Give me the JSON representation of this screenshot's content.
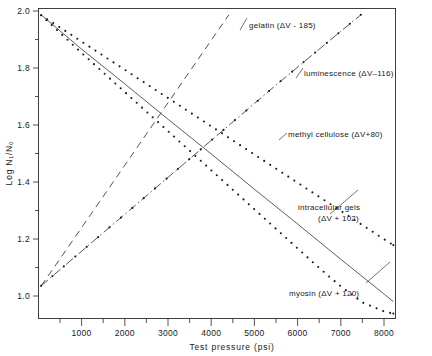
{
  "figure": {
    "background": "#ffffff",
    "ink_color": "#1a1a1a"
  },
  "axes": {
    "x_title": "Test pressure (psi)",
    "y_title": "Log N₁/N₀",
    "x_ticks": [
      "1000",
      "2000",
      "3000",
      "4000",
      "5000",
      "6000",
      "7000",
      "8000"
    ],
    "y_ticks": [
      "2.0",
      "1.8",
      "1.6",
      "1.4",
      "1.2",
      "1.0"
    ]
  },
  "labels": {
    "gelatin": "gelatin (ΔV - 185)",
    "luminescence": "luminescence (ΔV–116)",
    "methyl_cellulose": "methyl cellulose (ΔV+80)",
    "intracellular_gels_line1": "intracellular  gels",
    "intracellular_gels_line2": "(ΔV + 102)",
    "myosin": "myosin  (ΔV + 120)"
  },
  "chart_data": {
    "type": "line",
    "title": "",
    "xlabel": "Test pressure (psi)",
    "ylabel": "Log N₁/N₀",
    "xlim": [
      0,
      8250
    ],
    "ylim": [
      0.88,
      2.02
    ],
    "xticks": [
      1000,
      2000,
      3000,
      4000,
      5000,
      6000,
      7000,
      8000
    ],
    "yticks": [
      1.0,
      1.2,
      1.4,
      1.6,
      1.8,
      2.0
    ],
    "x_minor_ticks": [
      500,
      1500,
      2500,
      3500,
      4500,
      5500,
      6500,
      7500
    ],
    "y_minor_ticks": [
      1.1,
      1.3,
      1.5,
      1.7,
      1.9
    ],
    "grid": false,
    "legend": "annotations-inline",
    "series": [
      {
        "name": "gelatin (ΔV - 185)",
        "style": "dashed",
        "marker": "none",
        "delta_v": -185,
        "direction": "ascending",
        "points": [
          [
            60,
            1.0
          ],
          [
            500,
            1.1
          ],
          [
            1000,
            1.215
          ],
          [
            1500,
            1.33
          ],
          [
            2000,
            1.445
          ],
          [
            2500,
            1.56
          ],
          [
            3000,
            1.675
          ],
          [
            3500,
            1.79
          ],
          [
            4000,
            1.905
          ],
          [
            4400,
            1.997
          ]
        ]
      },
      {
        "name": "luminescence (ΔV–116)",
        "style": "dash-dot-with-dots",
        "marker": "dot",
        "delta_v": -116,
        "direction": "ascending",
        "points": [
          [
            60,
            1.0
          ],
          [
            500,
            1.06
          ],
          [
            1000,
            1.128
          ],
          [
            1500,
            1.196
          ],
          [
            2000,
            1.264
          ],
          [
            2500,
            1.332
          ],
          [
            3000,
            1.4
          ],
          [
            3500,
            1.468
          ],
          [
            4000,
            1.536
          ],
          [
            4500,
            1.604
          ],
          [
            5000,
            1.672
          ],
          [
            5500,
            1.74
          ],
          [
            6000,
            1.806
          ],
          [
            6500,
            1.872
          ],
          [
            7000,
            1.938
          ],
          [
            7450,
            1.997
          ]
        ]
      },
      {
        "name": "methyl cellulose (ΔV+80)",
        "style": "dotted",
        "marker": "dot",
        "delta_v": 80,
        "direction": "descending",
        "points": [
          [
            60,
            1.995
          ],
          [
            500,
            1.95
          ],
          [
            1000,
            1.898
          ],
          [
            1500,
            1.846
          ],
          [
            2000,
            1.794
          ],
          [
            2500,
            1.742
          ],
          [
            3000,
            1.69
          ],
          [
            3500,
            1.638
          ],
          [
            4000,
            1.586
          ],
          [
            4500,
            1.534
          ],
          [
            5000,
            1.482
          ],
          [
            5500,
            1.43
          ],
          [
            6000,
            1.378
          ],
          [
            6500,
            1.326
          ],
          [
            7000,
            1.274
          ],
          [
            7500,
            1.222
          ],
          [
            8000,
            1.17
          ],
          [
            8200,
            1.15
          ]
        ]
      },
      {
        "name": "intracellular gels (ΔV + 102)",
        "style": "solid",
        "marker": "none",
        "delta_v": 102,
        "direction": "descending",
        "points": [
          [
            60,
            1.997
          ],
          [
            1000,
            1.87
          ],
          [
            2000,
            1.742
          ],
          [
            3000,
            1.612
          ],
          [
            4000,
            1.484
          ],
          [
            5000,
            1.354
          ],
          [
            6000,
            1.226
          ],
          [
            7000,
            1.096
          ],
          [
            8000,
            0.968
          ],
          [
            8200,
            0.942
          ]
        ]
      },
      {
        "name": "myosin (ΔV + 120)",
        "style": "dotted",
        "marker": "dot",
        "delta_v": 120,
        "direction": "descending",
        "points": [
          [
            60,
            1.995
          ],
          [
            500,
            1.93
          ],
          [
            1000,
            1.856
          ],
          [
            1500,
            1.784
          ],
          [
            2000,
            1.712
          ],
          [
            2500,
            1.64
          ],
          [
            3000,
            1.568
          ],
          [
            3500,
            1.496
          ],
          [
            4000,
            1.424
          ],
          [
            4500,
            1.352
          ],
          [
            5000,
            1.28
          ],
          [
            5500,
            1.208
          ],
          [
            6000,
            1.136
          ],
          [
            6500,
            1.064
          ],
          [
            7000,
            0.996
          ],
          [
            7500,
            0.938
          ],
          [
            8000,
            0.905
          ],
          [
            8200,
            0.898
          ]
        ]
      }
    ],
    "annotations": [
      {
        "text": "gelatin (ΔV - 185)",
        "x": 3150,
        "y": 1.955
      },
      {
        "text": "luminescence (ΔV–116)",
        "x": 4850,
        "y": 1.79
      },
      {
        "text": "methyl cellulose (ΔV+80)",
        "x": 4400,
        "y": 1.545
      },
      {
        "text": "intracellular gels (ΔV + 102)",
        "x": 5050,
        "y": 1.29
      },
      {
        "text": "myosin (ΔV + 120)",
        "x": 4600,
        "y": 0.975
      }
    ]
  }
}
